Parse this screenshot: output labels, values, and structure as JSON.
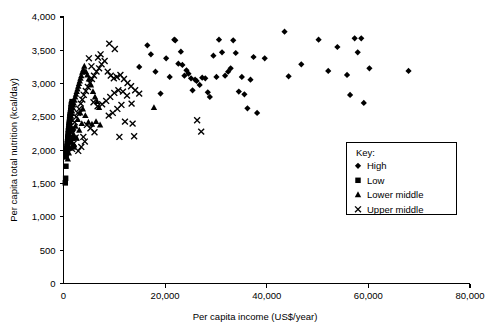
{
  "chart_data": {
    "type": "scatter",
    "title": "",
    "xlabel": "Per capita income (US$/year)",
    "ylabel": "Per capita total nutrition (kcal/day)",
    "xlim": [
      0,
      80000
    ],
    "ylim": [
      0,
      4000
    ],
    "xticks": [
      0,
      20000,
      40000,
      60000,
      80000
    ],
    "xticklabels": [
      "0",
      "20,000",
      "40,000",
      "60,000",
      "80,000"
    ],
    "yticks": [
      0,
      500,
      1000,
      1500,
      2000,
      2500,
      3000,
      3500,
      4000
    ],
    "yticklabels": [
      "0",
      "500",
      "1,000",
      "1,500",
      "2,000",
      "2,500",
      "3,000",
      "3,500",
      "4,000"
    ],
    "grid": false,
    "legend_position": "center-right",
    "legend_title": "Key:",
    "series": [
      {
        "name": "High",
        "marker": "diamond",
        "color": "#000000",
        "points": [
          [
            14900,
            3250
          ],
          [
            16500,
            3575
          ],
          [
            17200,
            3440
          ],
          [
            18100,
            3180
          ],
          [
            19100,
            2850
          ],
          [
            20200,
            3380
          ],
          [
            20900,
            3100
          ],
          [
            21800,
            3660
          ],
          [
            22000,
            3650
          ],
          [
            22600,
            3300
          ],
          [
            23100,
            3480
          ],
          [
            23400,
            3280
          ],
          [
            23800,
            3120
          ],
          [
            24200,
            3200
          ],
          [
            24600,
            3150
          ],
          [
            25100,
            3080
          ],
          [
            25400,
            2900
          ],
          [
            25900,
            3060
          ],
          [
            26200,
            3040
          ],
          [
            26800,
            2980
          ],
          [
            27300,
            3090
          ],
          [
            27900,
            3080
          ],
          [
            28400,
            2870
          ],
          [
            28800,
            2800
          ],
          [
            29500,
            3420
          ],
          [
            30100,
            3100
          ],
          [
            30600,
            3660
          ],
          [
            31200,
            3470
          ],
          [
            31800,
            3120
          ],
          [
            32400,
            3180
          ],
          [
            32900,
            3230
          ],
          [
            33400,
            3650
          ],
          [
            33900,
            3460
          ],
          [
            34500,
            2880
          ],
          [
            35100,
            3100
          ],
          [
            35600,
            2840
          ],
          [
            36200,
            2630
          ],
          [
            36800,
            3060
          ],
          [
            37400,
            3400
          ],
          [
            38100,
            2560
          ],
          [
            39600,
            3380
          ],
          [
            43500,
            3780
          ],
          [
            44300,
            3110
          ],
          [
            46800,
            3290
          ],
          [
            50200,
            3660
          ],
          [
            52100,
            3190
          ],
          [
            53900,
            3550
          ],
          [
            55800,
            3130
          ],
          [
            56400,
            2830
          ],
          [
            57300,
            3680
          ],
          [
            57900,
            3470
          ],
          [
            58600,
            3680
          ],
          [
            59100,
            2710
          ],
          [
            60200,
            3230
          ],
          [
            67900,
            3190
          ]
        ]
      },
      {
        "name": "Low",
        "marker": "square",
        "color": "#000000",
        "points": [
          [
            350,
            1510
          ],
          [
            420,
            1580
          ],
          [
            480,
            1760
          ],
          [
            520,
            1900
          ],
          [
            560,
            1950
          ],
          [
            610,
            1990
          ],
          [
            650,
            2030
          ],
          [
            700,
            2060
          ],
          [
            740,
            2100
          ],
          [
            790,
            2130
          ],
          [
            830,
            2180
          ],
          [
            880,
            2210
          ],
          [
            920,
            2250
          ],
          [
            960,
            2290
          ],
          [
            1010,
            2320
          ],
          [
            1060,
            2360
          ],
          [
            1100,
            2390
          ],
          [
            1150,
            2420
          ],
          [
            1200,
            2460
          ],
          [
            1250,
            2500
          ],
          [
            1300,
            2530
          ],
          [
            1360,
            2560
          ],
          [
            1420,
            2600
          ],
          [
            1480,
            2640
          ],
          [
            1540,
            2680
          ],
          [
            1600,
            2700
          ],
          [
            1680,
            2730
          ],
          [
            1760,
            2310
          ],
          [
            1840,
            2180
          ],
          [
            1920,
            2050
          ]
        ]
      },
      {
        "name": "Lower middle",
        "marker": "triangle",
        "color": "#000000",
        "points": [
          [
            600,
            1990
          ],
          [
            700,
            2050
          ],
          [
            820,
            2120
          ],
          [
            900,
            2200
          ],
          [
            1000,
            2260
          ],
          [
            1100,
            2310
          ],
          [
            1200,
            2370
          ],
          [
            1300,
            2420
          ],
          [
            1400,
            2460
          ],
          [
            1500,
            2510
          ],
          [
            1600,
            2550
          ],
          [
            1700,
            2590
          ],
          [
            1800,
            2640
          ],
          [
            1900,
            2680
          ],
          [
            2000,
            2710
          ],
          [
            2150,
            2750
          ],
          [
            2300,
            2800
          ],
          [
            2450,
            2840
          ],
          [
            2600,
            2880
          ],
          [
            2750,
            2920
          ],
          [
            2900,
            2960
          ],
          [
            3050,
            3000
          ],
          [
            3200,
            3040
          ],
          [
            3350,
            3080
          ],
          [
            3500,
            3120
          ],
          [
            3700,
            3170
          ],
          [
            3900,
            3210
          ],
          [
            4100,
            3260
          ],
          [
            4400,
            3180
          ],
          [
            4700,
            3130
          ],
          [
            5000,
            3070
          ],
          [
            5400,
            2980
          ],
          [
            5800,
            2880
          ],
          [
            6200,
            2800
          ],
          [
            6600,
            2730
          ],
          [
            7000,
            2640
          ],
          [
            1250,
            2030
          ],
          [
            1550,
            2120
          ],
          [
            1950,
            2240
          ],
          [
            2350,
            2360
          ],
          [
            2800,
            2460
          ],
          [
            3300,
            2560
          ],
          [
            3800,
            2620
          ],
          [
            4300,
            2520
          ],
          [
            4900,
            2420
          ],
          [
            5600,
            2390
          ],
          [
            6400,
            2430
          ],
          [
            7200,
            2380
          ],
          [
            2100,
            2080
          ],
          [
            2600,
            2180
          ],
          [
            3100,
            2300
          ],
          [
            3600,
            2400
          ],
          [
            850,
            1870
          ],
          [
            1050,
            1960
          ],
          [
            1450,
            2150
          ],
          [
            17800,
            2640
          ]
        ]
      },
      {
        "name": "Upper middle",
        "marker": "cross",
        "color": "#000000",
        "points": [
          [
            1600,
            2260
          ],
          [
            1900,
            2340
          ],
          [
            2200,
            2420
          ],
          [
            2500,
            2500
          ],
          [
            2800,
            2560
          ],
          [
            3100,
            2620
          ],
          [
            3400,
            2700
          ],
          [
            3700,
            2760
          ],
          [
            4000,
            2830
          ],
          [
            4400,
            2890
          ],
          [
            4800,
            2950
          ],
          [
            5200,
            3010
          ],
          [
            5600,
            3070
          ],
          [
            6000,
            3120
          ],
          [
            6500,
            3180
          ],
          [
            7000,
            3230
          ],
          [
            7500,
            3290
          ],
          [
            8100,
            3340
          ],
          [
            8700,
            3180
          ],
          [
            9300,
            3120
          ],
          [
            9900,
            3080
          ],
          [
            10500,
            3100
          ],
          [
            11200,
            3130
          ],
          [
            11900,
            3070
          ],
          [
            12600,
            3010
          ],
          [
            13300,
            2960
          ],
          [
            14100,
            2900
          ],
          [
            14900,
            2850
          ],
          [
            9000,
            3600
          ],
          [
            10100,
            3520
          ],
          [
            7300,
            3440
          ],
          [
            6800,
            3390
          ],
          [
            5900,
            2720
          ],
          [
            6700,
            2660
          ],
          [
            7600,
            2690
          ],
          [
            8400,
            2740
          ],
          [
            9200,
            2800
          ],
          [
            10000,
            2860
          ],
          [
            10800,
            2900
          ],
          [
            11700,
            2880
          ],
          [
            12500,
            2820
          ],
          [
            13400,
            2700
          ],
          [
            4600,
            2380
          ],
          [
            5300,
            2330
          ],
          [
            6100,
            2270
          ],
          [
            3900,
            2200
          ],
          [
            4200,
            2130
          ],
          [
            3500,
            2050
          ],
          [
            2900,
            1990
          ],
          [
            12100,
            2430
          ],
          [
            13600,
            2400
          ],
          [
            13900,
            2210
          ],
          [
            11000,
            2200
          ],
          [
            26300,
            2450
          ],
          [
            27100,
            2280
          ],
          [
            2400,
            2190
          ],
          [
            2000,
            2100
          ],
          [
            1700,
            2020
          ],
          [
            8900,
            2520
          ],
          [
            9700,
            2560
          ],
          [
            10600,
            2620
          ],
          [
            11400,
            2680
          ],
          [
            5000,
            3380
          ],
          [
            5500,
            3260
          ]
        ]
      }
    ]
  },
  "legend": {
    "title": "Key:",
    "items": [
      {
        "label": "High",
        "marker": "diamond"
      },
      {
        "label": "Low",
        "marker": "square"
      },
      {
        "label": "Lower middle",
        "marker": "triangle"
      },
      {
        "label": "Upper middle",
        "marker": "cross"
      }
    ]
  }
}
